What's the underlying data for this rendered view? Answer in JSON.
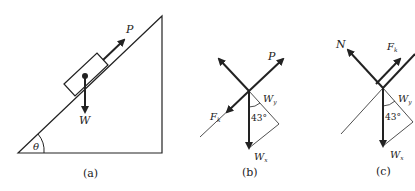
{
  "figure": {
    "panel_a": {
      "caption": "(a)",
      "angle_label": "θ",
      "force_push": "P",
      "weight": "W"
    },
    "panel_b": {
      "caption": "(b)",
      "force_push": "P",
      "friction": "F",
      "friction_sub": "k",
      "perp_component": "W",
      "perp_sub": "y",
      "parallel_component": "W",
      "parallel_sub": "x",
      "angle": "43°"
    },
    "panel_c": {
      "caption": "(c)",
      "normal": "N",
      "friction": "F",
      "friction_sub": "k",
      "perp_component": "W",
      "perp_sub": "y",
      "parallel_component": "W",
      "parallel_sub": "x",
      "angle": "43°"
    }
  },
  "colors": {
    "line": "#222222"
  }
}
